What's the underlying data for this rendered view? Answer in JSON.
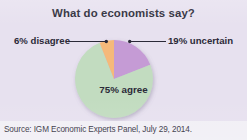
{
  "figure": {
    "title": "What do economists say?",
    "source_note": "Source: IGM Economic Experts Panel, July 29, 2014.",
    "background_color": "#e7e1ef",
    "footer_background_color": "#f1eff5",
    "text_color": "#2b2a38"
  },
  "labels": {
    "disagree": "6% disagree",
    "uncertain": "19% uncertain",
    "agree": "75% agree"
  },
  "chart_data": {
    "type": "pie",
    "title": "What do economists say?",
    "xlabel": "",
    "ylabel": "",
    "legend_position": "none",
    "grid": false,
    "units": "percent",
    "start_angle_deg": 0,
    "direction": "clockwise",
    "categories": [
      "19% uncertain",
      "75% agree",
      "6% disagree"
    ],
    "values": [
      19,
      75,
      6
    ],
    "slices": [
      {
        "label": "19% uncertain",
        "short_label": "uncertain",
        "value": 19,
        "color": "#c59bd5",
        "start_deg": 0,
        "end_deg": 68.4,
        "callout": true,
        "callout_side": "right"
      },
      {
        "label": "75% agree",
        "short_label": "agree",
        "value": 75,
        "color": "#c2dcc0",
        "start_deg": 68.4,
        "end_deg": 338.4,
        "callout": false,
        "callout_side": "inside"
      },
      {
        "label": "6% disagree",
        "short_label": "disagree",
        "value": 6,
        "color": "#f5b97a",
        "start_deg": 338.4,
        "end_deg": 360,
        "callout": true,
        "callout_side": "left"
      }
    ]
  }
}
